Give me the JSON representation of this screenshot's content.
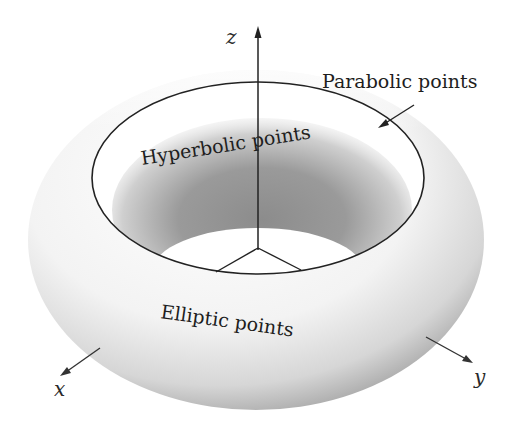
{
  "figure": {
    "labels": {
      "parabolic": "Parabolic points",
      "hyperbolic": "Hyperbolic points",
      "elliptic": "Elliptic points"
    },
    "axes": {
      "x": "x",
      "y": "y",
      "z": "z"
    }
  },
  "colors": {
    "background": "#ffffff",
    "line": "#222222",
    "shade_dark": "#8a8a8a",
    "shade_light": "#f4f4f4"
  }
}
